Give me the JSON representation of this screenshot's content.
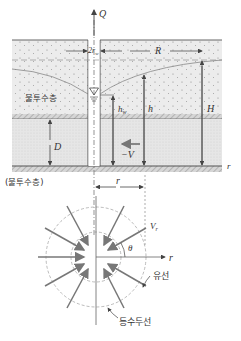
{
  "figure": {
    "type": "well_radial_flow_diagram",
    "cross_section": {
      "labels": {
        "discharge": "Q",
        "well_diameter": "2r_w",
        "well_diameter_main": "2r",
        "well_diameter_sub": "w",
        "radius_of_influence": "R",
        "impermeable_upper": "불투수층",
        "well_head": "h_w",
        "well_head_main": "h",
        "well_head_sub": "w",
        "head": "h",
        "original_head": "H",
        "aquifer_thickness": "D",
        "velocity": "−V",
        "radial_axis": "r",
        "impermeable_lower": "(불투수층)",
        "distance": "r"
      }
    },
    "plan_view": {
      "labels": {
        "radial_velocity": "V_r",
        "radial_velocity_main": "V",
        "radial_velocity_sub": "r",
        "angle": "θ",
        "radial_axis": "r",
        "streamline": "유선",
        "equipotential": "등수두선"
      }
    },
    "colors": {
      "stroke": "#555555",
      "sand_fill": "#ececec",
      "aquifer_fill": "#e4e4e4",
      "hatch": "#9a9a9a",
      "arrow": "#777777",
      "dashed_circle": "#aaaaaa"
    }
  }
}
